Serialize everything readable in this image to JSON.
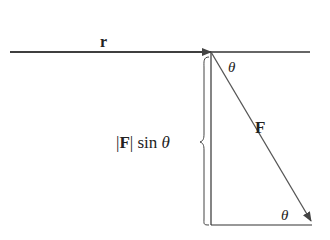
{
  "diagram": {
    "labels": {
      "r": "r",
      "theta_top": "θ",
      "theta_bottom": "θ",
      "F": "F",
      "perp_bar_left": "|",
      "perp_F": "F",
      "perp_bar_right": "|",
      "perp_sin": " sin ",
      "perp_theta": "θ"
    },
    "colors": {
      "line": "#333333",
      "arrow": "#555555",
      "text": "#222222"
    }
  }
}
